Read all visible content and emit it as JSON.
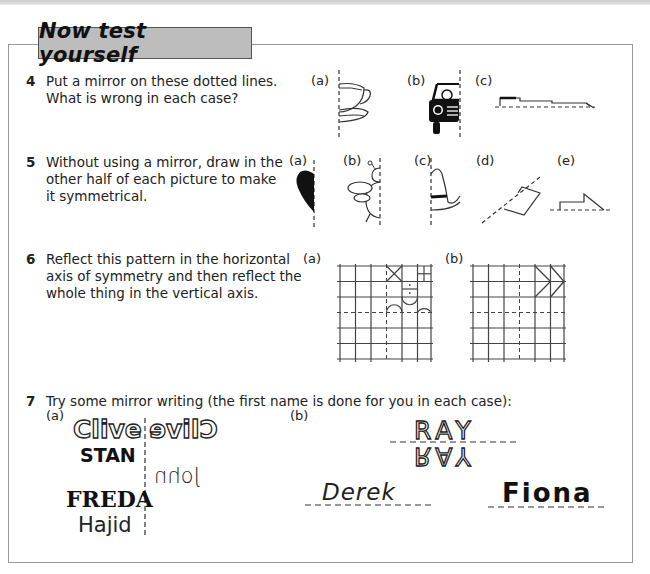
{
  "header": {
    "title": "Now test yourself"
  },
  "questions": [
    {
      "number": "4",
      "text_lines": [
        "Put a mirror on these dotted lines.",
        "What is wrong in each case?"
      ],
      "parts": [
        {
          "label": "(a)",
          "picture": "half teacup and saucer"
        },
        {
          "label": "(b)",
          "picture": "half car front"
        },
        {
          "label": "(c)",
          "picture": "flat shape on horizontal dotted line"
        }
      ]
    },
    {
      "number": "5",
      "text_lines": [
        "Without using a mirror, draw in the",
        "other half of each picture to make",
        "it symmetrical."
      ],
      "parts": [
        {
          "label": "(a)",
          "picture": "half heart"
        },
        {
          "label": "(b)",
          "picture": "half bee"
        },
        {
          "label": "(c)",
          "picture": "half hat"
        },
        {
          "label": "(d)",
          "picture": "quadrilateral on diagonal line"
        },
        {
          "label": "(e)",
          "picture": "step shape on horizontal line"
        }
      ]
    },
    {
      "number": "6",
      "text_lines": [
        "Reflect this pattern in the horizontal",
        "axis of symmetry and then reflect the",
        "whole thing in the vertical axis."
      ],
      "parts": [
        {
          "label": "(a)",
          "picture": "6x6 grid with cross, small square, arches"
        },
        {
          "label": "(b)",
          "picture": "6x6 grid with two chevrons"
        }
      ]
    },
    {
      "number": "7",
      "text_lines": [
        "Try some mirror writing (the first name is done for you in each case):"
      ],
      "parts": [
        {
          "label": "(a)",
          "names": [
            "Clive",
            "STAN",
            "John",
            "FREDA",
            "Hajid"
          ],
          "mirrored_examples": [
            "Clive",
            "John"
          ]
        },
        {
          "label": "(b)",
          "names": [
            "RAY",
            "Derek",
            "Fiona"
          ],
          "mirrored_examples": [
            "RAY"
          ]
        }
      ]
    }
  ]
}
